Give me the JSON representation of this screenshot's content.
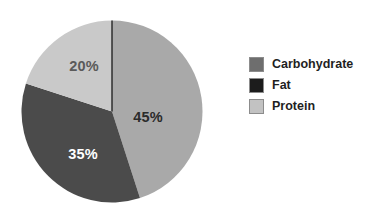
{
  "chart_data": {
    "type": "pie",
    "title": "",
    "subtitle": "",
    "xlabel": "",
    "ylabel": "",
    "grid": false,
    "legend_position": "right",
    "start_angle_deg": 0,
    "direction": "clockwise",
    "units": "percent",
    "total": 100,
    "categories": [
      "Carbohydrate",
      "Fat",
      "Protein"
    ],
    "values": [
      45,
      35,
      20
    ],
    "slices": [
      {
        "name": "Carbohydrate",
        "value": 45,
        "data_label": "45%",
        "color": "#a9a9a9",
        "swatch_color": "#6e6e6e",
        "label_color": "#2b2b2b",
        "start_deg": 0,
        "end_deg": 162
      },
      {
        "name": "Fat",
        "value": 35,
        "data_label": "35%",
        "color": "#4b4b4b",
        "swatch_color": "#1c1c1c",
        "label_color": "#ffffff",
        "start_deg": 162,
        "end_deg": 288
      },
      {
        "name": "Protein",
        "value": 20,
        "data_label": "20%",
        "color": "#c9c9c9",
        "swatch_color": "#c2c2c2",
        "label_color": "#5a5a5a",
        "start_deg": 288,
        "end_deg": 360
      }
    ],
    "annotations": [],
    "background_color": "#ffffff",
    "divider_line_color": "#1a1a1a"
  },
  "legend": {
    "entries": [
      {
        "label": "Carbohydrate"
      },
      {
        "label": "Fat"
      },
      {
        "label": "Protein"
      }
    ]
  }
}
